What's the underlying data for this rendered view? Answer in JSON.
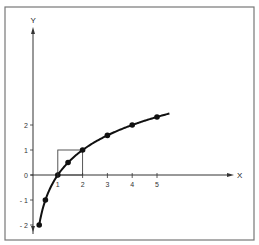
{
  "chart_data": {
    "type": "line",
    "title": "",
    "function": "y = log2(x)",
    "xlabel": "X",
    "ylabel": "Y",
    "xlim": [
      0,
      7.5
    ],
    "ylim": [
      -2.2,
      5.9
    ],
    "x_ticks": [
      1,
      2,
      3,
      4,
      5
    ],
    "x_tick_labels": [
      "1",
      "2",
      "3",
      "4",
      "5"
    ],
    "y_ticks": [
      -2,
      -1,
      0,
      1,
      2
    ],
    "y_tick_labels": [
      "- 2",
      "- 1",
      "0",
      "1",
      "2"
    ],
    "grid": false,
    "series": [
      {
        "name": "log2(x)",
        "points": [
          {
            "x": 0.25,
            "y": -2
          },
          {
            "x": 0.5,
            "y": -1
          },
          {
            "x": 1,
            "y": 0
          },
          {
            "x": 1.414,
            "y": 0.5
          },
          {
            "x": 2,
            "y": 1
          },
          {
            "x": 3,
            "y": 1.585
          },
          {
            "x": 4,
            "y": 2
          },
          {
            "x": 5,
            "y": 2.32
          }
        ],
        "curve_end_x": 5.5
      }
    ],
    "annotations": [
      {
        "type": "rectangle",
        "x_range": [
          1,
          2
        ],
        "y_range": [
          0,
          1
        ],
        "description": "unit square between x=1 and x=2"
      }
    ]
  },
  "colors": {
    "frame": "#777777",
    "axis": "#333333",
    "curve": "#111111"
  }
}
